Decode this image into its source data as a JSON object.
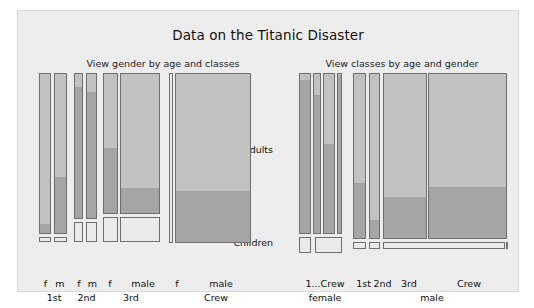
{
  "window": {
    "title": "Data on the Titanic Disaster",
    "background": "#ffffff",
    "panel_background": "#ededed"
  },
  "colors": {
    "panel": "#ededed",
    "cell_light": "#c2c2c2",
    "cell_dark": "#a5a5a5",
    "cell_border": "#6f6f6f",
    "text": "#111111"
  },
  "axis": {
    "adults_label": "Adults",
    "children_label": "Children"
  },
  "charts": [
    {
      "id": "left",
      "subtitle": "View gender by age and classes",
      "ticks": [
        {
          "label": "f",
          "cx": 7.5
        },
        {
          "label": "m",
          "cx": 22.0
        },
        {
          "label": "f",
          "cx": 41.0
        },
        {
          "label": "m",
          "cx": 54.5
        },
        {
          "label": "f",
          "cx": 72.0
        },
        {
          "label": "male",
          "cx": 105.0
        },
        {
          "label": "f",
          "cx": 139.0
        },
        {
          "label": "male",
          "cx": 183.0
        }
      ],
      "groups": [
        {
          "label": "1st",
          "cx": 16.0
        },
        {
          "label": "2nd",
          "cx": 48.5
        },
        {
          "label": "3rd",
          "cx": 93.0
        },
        {
          "label": "Crew",
          "cx": 178.0
        }
      ]
    },
    {
      "id": "right",
      "subtitle": "View classes by age and gender",
      "ticks": [
        {
          "label": "1...Crew",
          "cx": 26.0
        },
        {
          "label": "1st",
          "cx": 64.5
        },
        {
          "label": "2nd",
          "cx": 83.5
        },
        {
          "label": "3rd",
          "cx": 110.0
        },
        {
          "label": "Crew",
          "cx": 170.0
        }
      ],
      "groups": [
        {
          "label": "female",
          "cx": 26.0
        },
        {
          "label": "male",
          "cx": 133.0
        }
      ]
    }
  ],
  "chart_data": {
    "type": "bar",
    "title": "Data on the Titanic Disaster",
    "subtitles": [
      "View gender by age and classes",
      "View classes by age and gender"
    ],
    "xlabel": "",
    "ylabel": "",
    "ytick_labels": [
      "Adults",
      "Children"
    ],
    "grid": false,
    "legend": false,
    "note": "Mosaic / spine plot. Each cell width is proportional to group count; each cell is split vertically into a light upper segment and a darker lower segment (survival split). Adult rows occupy the tall upper band; child rows the short lower band.",
    "panels": [
      {
        "name": "View gender by age and classes",
        "group_axis": [
          "1st",
          "2nd",
          "3rd",
          "Crew"
        ],
        "sub_axis": [
          "f",
          "m",
          "f",
          "m",
          "f",
          "male",
          "f",
          "male"
        ],
        "cells": [
          {
            "group": "1st",
            "gender": "f",
            "age": "Adults",
            "x": 0.5,
            "w": 12.5,
            "y": 0.0,
            "h": 161.0,
            "dark_frac": 0.055
          },
          {
            "group": "1st",
            "gender": "m",
            "age": "Adults",
            "x": 15.5,
            "w": 13.5,
            "y": 0.0,
            "h": 161.0,
            "dark_frac": 0.345
          },
          {
            "group": "1st",
            "gender": "f",
            "age": "Children",
            "x": 0.5,
            "w": 12.5,
            "y": 164.0,
            "h": 5.0,
            "dark_frac": 0.0
          },
          {
            "group": "1st",
            "gender": "m",
            "age": "Children",
            "x": 15.5,
            "w": 13.5,
            "y": 164.0,
            "h": 5.0,
            "dark_frac": 0.0
          },
          {
            "group": "2nd",
            "gender": "f",
            "age": "Adults",
            "x": 35.5,
            "w": 9.0,
            "y": 0.0,
            "h": 146.0,
            "dark_frac": 0.9
          },
          {
            "group": "2nd",
            "gender": "m",
            "age": "Adults",
            "x": 48.0,
            "w": 11.0,
            "y": 0.0,
            "h": 146.0,
            "dark_frac": 0.86
          },
          {
            "group": "2nd",
            "gender": "f",
            "age": "Children",
            "x": 35.5,
            "w": 9.0,
            "y": 149.0,
            "h": 20.0,
            "dark_frac": 0.0
          },
          {
            "group": "2nd",
            "gender": "m",
            "age": "Children",
            "x": 48.0,
            "w": 11.0,
            "y": 149.0,
            "h": 20.0,
            "dark_frac": 0.0
          },
          {
            "group": "3rd",
            "gender": "f",
            "age": "Adults",
            "x": 65.0,
            "w": 15.0,
            "y": 0.0,
            "h": 141.0,
            "dark_frac": 0.46
          },
          {
            "group": "3rd",
            "gender": "male",
            "age": "Adults",
            "x": 82.0,
            "w": 40.0,
            "y": 0.0,
            "h": 141.0,
            "dark_frac": 0.18
          },
          {
            "group": "3rd",
            "gender": "f",
            "age": "Children",
            "x": 65.0,
            "w": 15.0,
            "y": 144.0,
            "h": 25.0,
            "dark_frac": 0.0
          },
          {
            "group": "3rd",
            "gender": "male",
            "age": "Children",
            "x": 82.0,
            "w": 40.0,
            "y": 144.0,
            "h": 25.0,
            "dark_frac": 0.0
          },
          {
            "group": "Crew",
            "gender": "f",
            "age": "Adults",
            "x": 131.0,
            "w": 3.5,
            "y": 0.0,
            "h": 170.0,
            "dark_frac": 0.0
          },
          {
            "group": "Crew",
            "gender": "male",
            "age": "Adults",
            "x": 136.5,
            "w": 76.0,
            "y": 0.0,
            "h": 170.0,
            "dark_frac": 0.3
          }
        ]
      },
      {
        "name": "View classes by age and gender",
        "group_axis": [
          "female",
          "male"
        ],
        "sub_axis": [
          "1st",
          "2nd",
          "3rd",
          "Crew",
          "1st",
          "2nd",
          "3rd",
          "Crew"
        ],
        "cells": [
          {
            "group": "female",
            "class": "1st",
            "age": "Adults",
            "x": 0.0,
            "w": 12.0,
            "y": 0.0,
            "h": 161.0,
            "dark_frac": 0.95
          },
          {
            "group": "female",
            "class": "2nd",
            "age": "Adults",
            "x": 14.0,
            "w": 8.0,
            "y": 0.0,
            "h": 161.0,
            "dark_frac": 0.86
          },
          {
            "group": "female",
            "class": "3rd",
            "age": "Adults",
            "x": 24.0,
            "w": 12.0,
            "y": 0.0,
            "h": 161.0,
            "dark_frac": 0.55
          },
          {
            "group": "female",
            "class": "Crew",
            "age": "Adults",
            "x": 38.0,
            "w": 5.0,
            "y": 0.0,
            "h": 161.0,
            "dark_frac": 0.98
          },
          {
            "group": "female",
            "class": "1st",
            "age": "Children",
            "x": 0.0,
            "w": 12.0,
            "y": 164.0,
            "h": 16.0,
            "dark_frac": 0.0
          },
          {
            "group": "female",
            "class": "3rd",
            "age": "Children",
            "x": 16.0,
            "w": 27.0,
            "y": 164.0,
            "h": 16.0,
            "dark_frac": 0.0
          },
          {
            "group": "male",
            "class": "1st",
            "age": "Adults",
            "x": 54.0,
            "w": 13.0,
            "y": 0.0,
            "h": 166.0,
            "dark_frac": 0.33
          },
          {
            "group": "male",
            "class": "2nd",
            "age": "Adults",
            "x": 70.0,
            "w": 11.0,
            "y": 0.0,
            "h": 166.0,
            "dark_frac": 0.11
          },
          {
            "group": "male",
            "class": "3rd",
            "age": "Adults",
            "x": 84.0,
            "w": 44.0,
            "y": 0.0,
            "h": 166.0,
            "dark_frac": 0.245
          },
          {
            "group": "male",
            "class": "Crew",
            "age": "Adults",
            "x": 129.0,
            "w": 79.0,
            "y": 0.0,
            "h": 166.0,
            "dark_frac": 0.305
          },
          {
            "group": "male",
            "class": "1st",
            "age": "Children",
            "x": 54.0,
            "w": 13.0,
            "y": 169.0,
            "h": 7.0,
            "dark_frac": 0.0
          },
          {
            "group": "male",
            "class": "2nd",
            "age": "Children",
            "x": 70.0,
            "w": 11.0,
            "y": 169.0,
            "h": 7.0,
            "dark_frac": 0.0
          },
          {
            "group": "male",
            "class": "3rd",
            "age": "Children",
            "x": 84.0,
            "w": 122.0,
            "y": 169.0,
            "h": 7.0,
            "dark_frac": 0.0
          },
          {
            "group": "male",
            "class": "Crew",
            "age": "Children",
            "x": 207.0,
            "w": 1.0,
            "y": 169.0,
            "h": 7.0,
            "dark_frac": 0.0
          }
        ]
      }
    ]
  }
}
